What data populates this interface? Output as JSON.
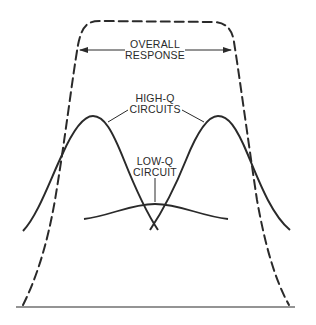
{
  "diagram": {
    "labels": {
      "overall_line1": "OVERALL",
      "overall_line2": "RESPONSE",
      "highq_line1": "HIGH-Q",
      "highq_line2": "CIRCUITS",
      "lowq_line1": "LOW-Q",
      "lowq_line2": "CIRCUIT"
    },
    "curves": [
      {
        "name": "overall-response",
        "style": "dashed",
        "description": "Flat-topped wide passband"
      },
      {
        "name": "high-q-circuit-left",
        "style": "solid",
        "description": "Narrow peaked response, lower tuned"
      },
      {
        "name": "high-q-circuit-right",
        "style": "solid",
        "description": "Narrow peaked response, higher tuned"
      },
      {
        "name": "low-q-circuit",
        "style": "solid",
        "description": "Broad low-amplitude response"
      }
    ],
    "colors": {
      "ink": "#2a2a2a",
      "background": "#ffffff"
    }
  }
}
